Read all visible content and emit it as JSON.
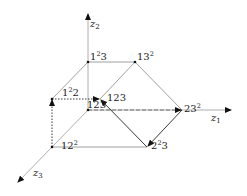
{
  "diagram": {
    "axes": [
      {
        "id": "z1",
        "label": "z",
        "sub": "1"
      },
      {
        "id": "z2",
        "label": "z",
        "sub": "2"
      },
      {
        "id": "z3",
        "label": "z",
        "sub": "3"
      }
    ],
    "nodes": {
      "n1sq3": {
        "base": "1",
        "sup": "2",
        "rest": "3"
      },
      "n13sq": {
        "base": "13",
        "sup": "2",
        "rest": ""
      },
      "n1sq2": {
        "base": "1",
        "sup": "2",
        "rest": "2"
      },
      "n123_upper": {
        "base": "123",
        "sup": "",
        "rest": ""
      },
      "n123_origin": {
        "base": "123",
        "sup": "",
        "rest": ""
      },
      "n23sq": {
        "base": "23",
        "sup": "2",
        "rest": ""
      },
      "n12sq": {
        "base": "12",
        "sup": "2",
        "rest": ""
      },
      "n2sq3": {
        "base": "2",
        "sup": "2",
        "rest": "3"
      }
    },
    "edges": [
      {
        "from": "1²3",
        "to": "13²",
        "style": "solid"
      },
      {
        "from": "1²3",
        "to": "1²2",
        "style": "solid"
      },
      {
        "from": "13²",
        "to": "123",
        "style": "solid"
      },
      {
        "from": "13²",
        "to": "23²",
        "style": "solid"
      },
      {
        "from": "1²2",
        "to": "123",
        "style": "dotted",
        "arrow": "end"
      },
      {
        "from": "12²",
        "to": "1²2",
        "style": "dotted",
        "arrow": "end"
      },
      {
        "from": "12²",
        "to": "2²3",
        "style": "solid"
      },
      {
        "from": "2²3",
        "to": "123",
        "style": "solid",
        "arrow": "end"
      },
      {
        "from": "123(origin)",
        "to": "23²",
        "style": "dashed",
        "arrow": "end"
      },
      {
        "from": "23²",
        "to": "2²3",
        "style": "solid",
        "arrow": "end"
      }
    ]
  }
}
